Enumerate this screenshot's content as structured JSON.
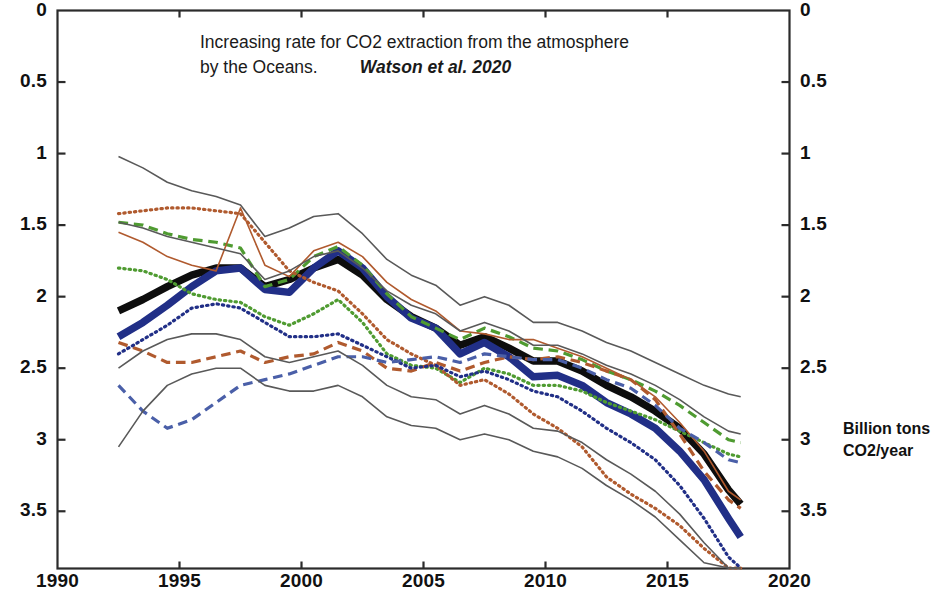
{
  "title": {
    "line1": "Increasing rate for CO2 extraction from the atmosphere",
    "line2": "by the Oceans.",
    "citation": "Watson et al. 2020"
  },
  "axis_unit_label": {
    "line1": "Billion tons",
    "line2": "CO2/year"
  },
  "chart_data": {
    "type": "line",
    "title": "Increasing rate for CO2 extraction from the atmosphere by the Oceans.",
    "annotations": [
      "Watson et al. 2020"
    ],
    "xlabel": "",
    "ylabel": "Billion tons CO2/year",
    "xlim": [
      1990,
      2020
    ],
    "ylim": [
      0,
      3.9
    ],
    "y_inverted": true,
    "grid": false,
    "legend": "none",
    "xticks": [
      1990,
      1995,
      2000,
      2005,
      2010,
      2015,
      2020
    ],
    "xtick_labels": [
      "1990",
      "1995",
      "2000",
      "2005",
      "2010",
      "2015",
      "2020"
    ],
    "yticks": [
      0,
      0.5,
      1,
      1.5,
      2,
      2.5,
      3,
      3.5
    ],
    "ytick_labels": [
      "0",
      "0.5",
      "1",
      "1.5",
      "2",
      "2.5",
      "3",
      "3.5"
    ],
    "ytick_labels_right": [
      "0",
      "0.5",
      "1",
      "1.5",
      "2",
      "2.5",
      "3",
      "3.5"
    ],
    "colors": {
      "black": "#0d0d0d",
      "blue": "#212f87",
      "green": "#4f9b31",
      "orange": "#b05a2e",
      "envelope": "#595959"
    },
    "x": [
      1992.5,
      1993.5,
      1994.5,
      1995.5,
      1996.5,
      1997.5,
      1998.5,
      1999.5,
      2000.5,
      2001.5,
      2002.5,
      2003.5,
      2004.5,
      2005.5,
      2006.5,
      2007.5,
      2008.5,
      2009.5,
      2010.5,
      2011.5,
      2012.5,
      2013.5,
      2014.5,
      2015.5,
      2016.5,
      2017.5,
      2018.0
    ],
    "series": [
      {
        "name": "ensemble-mean",
        "style": "solid",
        "width": "thick",
        "color": "#0d0d0d",
        "values": [
          2.1,
          2.02,
          1.93,
          1.85,
          1.8,
          1.8,
          1.93,
          1.88,
          1.8,
          1.74,
          1.85,
          2.02,
          2.14,
          2.22,
          2.34,
          2.28,
          2.36,
          2.45,
          2.45,
          2.52,
          2.62,
          2.7,
          2.8,
          2.92,
          3.1,
          3.35,
          3.45
        ]
      },
      {
        "name": "observation-based-estimate",
        "style": "solid",
        "width": "thick",
        "color": "#212f87",
        "values": [
          2.28,
          2.18,
          2.06,
          1.93,
          1.82,
          1.8,
          1.95,
          1.97,
          1.8,
          1.68,
          1.8,
          2.0,
          2.15,
          2.22,
          2.4,
          2.32,
          2.42,
          2.56,
          2.55,
          2.62,
          2.74,
          2.82,
          2.92,
          3.08,
          3.28,
          3.55,
          3.68
        ]
      },
      {
        "name": "model-green-dashed",
        "style": "dashed",
        "width": "medium",
        "color": "#4f9b31",
        "values": [
          1.48,
          1.5,
          1.56,
          1.6,
          1.62,
          1.66,
          1.93,
          1.88,
          1.72,
          1.65,
          1.78,
          1.98,
          2.14,
          2.22,
          2.3,
          2.22,
          2.28,
          2.36,
          2.38,
          2.44,
          2.52,
          2.58,
          2.66,
          2.76,
          2.88,
          3.0,
          3.02
        ]
      },
      {
        "name": "model-green-dotted",
        "style": "dotted",
        "width": "medium",
        "color": "#4f9b31",
        "values": [
          1.8,
          1.82,
          1.88,
          1.98,
          2.02,
          2.04,
          2.14,
          2.2,
          2.12,
          2.02,
          2.18,
          2.4,
          2.48,
          2.5,
          2.6,
          2.5,
          2.54,
          2.62,
          2.62,
          2.66,
          2.74,
          2.8,
          2.86,
          2.94,
          3.02,
          3.1,
          3.12
        ]
      },
      {
        "name": "model-orange-dotted",
        "style": "dotted",
        "width": "medium",
        "color": "#b05a2e",
        "values": [
          1.42,
          1.4,
          1.38,
          1.38,
          1.4,
          1.42,
          1.62,
          1.82,
          1.9,
          1.96,
          2.12,
          2.3,
          2.4,
          2.48,
          2.62,
          2.58,
          2.68,
          2.82,
          2.92,
          3.05,
          3.26,
          3.38,
          3.48,
          3.6,
          3.76,
          3.92,
          3.95
        ]
      },
      {
        "name": "model-orange-dashed",
        "style": "dashed",
        "width": "medium",
        "color": "#b05a2e",
        "values": [
          2.32,
          2.38,
          2.46,
          2.46,
          2.42,
          2.38,
          2.46,
          2.42,
          2.4,
          2.32,
          2.38,
          2.5,
          2.52,
          2.46,
          2.52,
          2.46,
          2.42,
          2.44,
          2.42,
          2.46,
          2.52,
          2.58,
          2.72,
          2.96,
          3.22,
          3.42,
          3.48
        ]
      },
      {
        "name": "model-orange-solid",
        "style": "solid",
        "width": "thin",
        "color": "#b05a2e",
        "values": [
          1.55,
          1.62,
          1.72,
          1.78,
          1.82,
          1.38,
          1.78,
          1.86,
          1.68,
          1.62,
          1.72,
          1.9,
          2.02,
          2.1,
          2.24,
          2.26,
          2.3,
          2.3,
          2.36,
          2.42,
          2.5,
          2.58,
          2.7,
          2.88,
          3.08,
          3.36,
          3.42
        ]
      },
      {
        "name": "model-blue-dotted",
        "style": "dotted",
        "width": "medium",
        "color": "#212f87",
        "values": [
          2.4,
          2.3,
          2.2,
          2.08,
          2.05,
          2.08,
          2.18,
          2.28,
          2.28,
          2.26,
          2.34,
          2.42,
          2.5,
          2.48,
          2.56,
          2.52,
          2.58,
          2.66,
          2.7,
          2.8,
          2.92,
          3.02,
          3.14,
          3.32,
          3.55,
          3.82,
          3.95
        ]
      },
      {
        "name": "model-blue-dashed",
        "style": "dashed",
        "width": "medium",
        "color": "#4a5fa8",
        "values": [
          2.62,
          2.8,
          2.92,
          2.86,
          2.74,
          2.62,
          2.58,
          2.54,
          2.48,
          2.42,
          2.42,
          2.46,
          2.44,
          2.42,
          2.46,
          2.4,
          2.42,
          2.44,
          2.44,
          2.5,
          2.58,
          2.64,
          2.76,
          2.92,
          3.02,
          3.14,
          3.16
        ]
      },
      {
        "name": "envelope-upper",
        "style": "solid",
        "width": "thin",
        "color": "#595959",
        "values": [
          1.02,
          1.1,
          1.2,
          1.26,
          1.3,
          1.36,
          1.58,
          1.52,
          1.44,
          1.42,
          1.56,
          1.74,
          1.85,
          1.92,
          2.06,
          2.0,
          2.06,
          2.18,
          2.18,
          2.24,
          2.32,
          2.38,
          2.46,
          2.54,
          2.62,
          2.68,
          2.7
        ]
      },
      {
        "name": "envelope-upper-inner",
        "style": "solid",
        "width": "thin",
        "color": "#595959",
        "values": [
          1.48,
          1.52,
          1.58,
          1.62,
          1.66,
          1.7,
          1.88,
          1.82,
          1.72,
          1.68,
          1.8,
          1.96,
          2.06,
          2.12,
          2.24,
          2.18,
          2.24,
          2.34,
          2.34,
          2.4,
          2.48,
          2.54,
          2.62,
          2.72,
          2.84,
          2.94,
          2.96
        ]
      },
      {
        "name": "envelope-lower-inner",
        "style": "solid",
        "width": "thin",
        "color": "#595959",
        "values": [
          2.5,
          2.38,
          2.3,
          2.26,
          2.26,
          2.3,
          2.42,
          2.46,
          2.42,
          2.38,
          2.48,
          2.62,
          2.7,
          2.72,
          2.82,
          2.76,
          2.82,
          2.92,
          2.94,
          3.02,
          3.14,
          3.24,
          3.36,
          3.52,
          3.72,
          3.92,
          3.96
        ]
      },
      {
        "name": "envelope-lower",
        "style": "solid",
        "width": "thin",
        "color": "#595959",
        "values": [
          3.05,
          2.8,
          2.62,
          2.54,
          2.5,
          2.5,
          2.62,
          2.66,
          2.66,
          2.62,
          2.7,
          2.84,
          2.9,
          2.92,
          3.0,
          2.96,
          3.0,
          3.08,
          3.12,
          3.2,
          3.32,
          3.42,
          3.54,
          3.7,
          3.86,
          3.98,
          4.0
        ]
      }
    ]
  }
}
